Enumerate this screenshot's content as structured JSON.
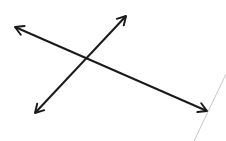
{
  "diagram": {
    "stroke_color": "#1a1a1a",
    "edge_line_color": "#c8c8c8",
    "lines": [
      {
        "id": "line-1",
        "x1": 15,
        "y1": 27,
        "x2": 207,
        "y2": 111
      },
      {
        "id": "line-2",
        "x1": 35,
        "y1": 113,
        "x2": 126,
        "y2": 16
      }
    ],
    "intersection": {
      "x": 87,
      "y": 58
    },
    "edge_line": {
      "x1": 226,
      "y1": 74,
      "x2": 194,
      "y2": 141
    }
  }
}
